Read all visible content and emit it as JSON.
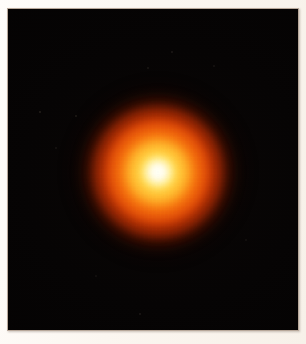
{
  "image": {
    "kind": "astronomical-photograph",
    "subject": "red supergiant star",
    "caption": "",
    "width_px": 306,
    "height_px": 344
  },
  "frame": {
    "mount_color": "#fbf6f0",
    "bevel_color": "#b8a89a",
    "border_left_px": 8,
    "border_top_px": 9,
    "border_right_px": 8,
    "border_bottom_px": 14
  },
  "plate": {
    "background_color": "#050304",
    "width_px": 290,
    "height_px": 321,
    "label": "deep space field"
  },
  "star": {
    "center_x_px": 158,
    "center_y_px": 172,
    "disk_radius_px": 80,
    "layers": [
      {
        "name": "outer-bloom",
        "color": "#961F03",
        "radius_px": 98
      },
      {
        "name": "red-halo",
        "color": "#CE3E06",
        "radius_px": 85
      },
      {
        "name": "deep-orange",
        "color": "#E75C0A",
        "radius_px": 72
      },
      {
        "name": "orange-shell",
        "color": "#FB9218",
        "radius_px": 55
      },
      {
        "name": "yellow-shell",
        "color": "#FFDA52",
        "radius_px": 39
      },
      {
        "name": "white-core",
        "color": "#FFFDF2",
        "radius_px": 21
      },
      {
        "name": "nucleus",
        "color": "#FFFFFA",
        "radius_px": 8
      }
    ]
  },
  "background_specks": [
    {
      "x_px": 40,
      "y_px": 112,
      "size_px": 2,
      "opacity": 0.12
    },
    {
      "x_px": 76,
      "y_px": 116,
      "size_px": 2,
      "opacity": 0.1
    },
    {
      "x_px": 172,
      "y_px": 52,
      "size_px": 2,
      "opacity": 0.09
    },
    {
      "x_px": 148,
      "y_px": 68,
      "size_px": 2,
      "opacity": 0.08
    },
    {
      "x_px": 214,
      "y_px": 66,
      "size_px": 2,
      "opacity": 0.07
    },
    {
      "x_px": 56,
      "y_px": 148,
      "size_px": 2,
      "opacity": 0.07
    },
    {
      "x_px": 140,
      "y_px": 314,
      "size_px": 2,
      "opacity": 0.09
    },
    {
      "x_px": 246,
      "y_px": 240,
      "size_px": 2,
      "opacity": 0.06
    },
    {
      "x_px": 96,
      "y_px": 276,
      "size_px": 2,
      "opacity": 0.06
    }
  ]
}
